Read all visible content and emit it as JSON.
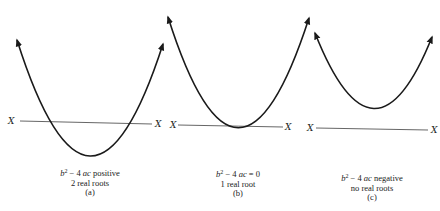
{
  "figure": {
    "axis_label": "X",
    "panels": [
      {
        "id": "a",
        "discriminant": {
          "b": "b",
          "exp": "2",
          "rest": " − 4 ",
          "ac": "ac",
          "condition": " positive"
        },
        "roots": "2 real roots",
        "tag": "(a)"
      },
      {
        "id": "b",
        "discriminant": {
          "b": "b",
          "exp": "2",
          "rest": " − 4 ",
          "ac": "ac",
          "condition": " = 0"
        },
        "roots": "1 real root",
        "tag": "(b)"
      },
      {
        "id": "c",
        "discriminant": {
          "b": "b",
          "exp": "2",
          "rest": " − 4 ",
          "ac": "ac",
          "condition": " negative"
        },
        "roots": "no real roots",
        "tag": "(c)"
      }
    ]
  },
  "colors": {
    "stroke": "#1a1a1a",
    "axis": "#555555",
    "text": "#222222"
  }
}
